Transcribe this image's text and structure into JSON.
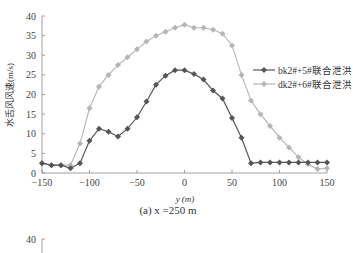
{
  "chart_data": {
    "type": "line",
    "title": "",
    "caption": "(a) x =250  m",
    "xlabel": "y (m)",
    "ylabel": "水舌风风速(m/s)",
    "xlim": [
      -150,
      150
    ],
    "ylim": [
      0,
      40
    ],
    "xticks": [
      -150,
      -100,
      -50,
      0,
      50,
      100,
      150
    ],
    "yticks": [
      0,
      5,
      10,
      15,
      20,
      25,
      30,
      35,
      40
    ],
    "grid": false,
    "legend_position": "right-middle",
    "series": [
      {
        "name": "bk2#+5#联合泄洪",
        "color": "#555555",
        "marker": "diamond",
        "x": [
          -150,
          -140,
          -130,
          -120,
          -110,
          -100,
          -90,
          -80,
          -70,
          -60,
          -50,
          -40,
          -30,
          -20,
          -10,
          0,
          10,
          20,
          30,
          40,
          50,
          60,
          70,
          80,
          90,
          100,
          110,
          120,
          130,
          140,
          150
        ],
        "values": [
          2.5,
          2.0,
          2.0,
          1.2,
          2.5,
          8.2,
          11.3,
          10.5,
          9.3,
          11.3,
          14.2,
          18.2,
          22.5,
          24.8,
          26.2,
          26.2,
          25.2,
          23.8,
          21.0,
          19.0,
          14.0,
          9.0,
          2.5,
          2.7,
          2.7,
          2.7,
          2.7,
          2.7,
          2.7,
          2.7,
          2.7
        ]
      },
      {
        "name": "dk2#+6#联合泄洪",
        "color": "#b5b5b5",
        "marker": "diamond",
        "x": [
          -150,
          -140,
          -130,
          -120,
          -110,
          -100,
          -90,
          -80,
          -70,
          -60,
          -50,
          -40,
          -30,
          -20,
          -10,
          0,
          10,
          20,
          30,
          40,
          50,
          60,
          70,
          80,
          90,
          100,
          110,
          120,
          130,
          140,
          150
        ],
        "values": [
          2.5,
          2.0,
          2.0,
          2.0,
          7.5,
          16.5,
          22.0,
          25.0,
          27.5,
          29.5,
          31.5,
          33.5,
          35.0,
          36.0,
          37.0,
          37.8,
          37.0,
          37.0,
          36.5,
          35.5,
          32.5,
          25.0,
          18.5,
          15.0,
          12.0,
          9.0,
          6.5,
          4.0,
          2.2,
          1.0,
          1.2
        ]
      }
    ]
  },
  "lower_panel": {
    "ytick_top": "40"
  }
}
